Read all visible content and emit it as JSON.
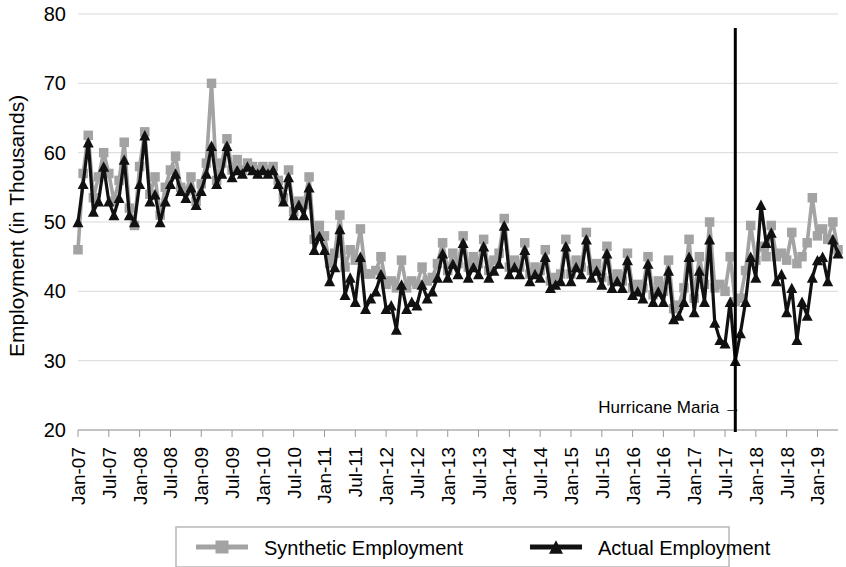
{
  "chart_data": {
    "type": "line",
    "title": "",
    "xlabel": "",
    "ylabel": "Employment (in Thousands)",
    "ylim": [
      20,
      80
    ],
    "yticks": [
      20,
      30,
      40,
      50,
      60,
      70,
      80
    ],
    "grid": true,
    "legend_position": "bottom",
    "x_tick_labels": [
      "Jan-07",
      "Jul-07",
      "Jan-08",
      "Jul-08",
      "Jan-09",
      "Jul-09",
      "Jan-10",
      "Jul-10",
      "Jan-11",
      "Jul-11",
      "Jan-12",
      "Jul-12",
      "Jan-13",
      "Jul-13",
      "Jan-14",
      "Jul-14",
      "Jan-15",
      "Jul-15",
      "Jan-16",
      "Jul-16",
      "Jan-17",
      "Jul-17",
      "Jan-18",
      "Jul-18",
      "Jan-19"
    ],
    "x_start": "Jan-07",
    "x_end": "Jan-19",
    "x_interval_months": 1,
    "annotations": [
      {
        "text": "Hurricane Maria →",
        "x": "Sep-17",
        "note": "vertical line at Sep-2017"
      }
    ],
    "series": [
      {
        "name": "Synthetic Employment",
        "color": "#a3a3a3",
        "marker": "square",
        "values": [
          46.0,
          57.0,
          62.5,
          53.5,
          56.5,
          60.0,
          57.0,
          53.0,
          56.0,
          61.5,
          52.0,
          49.5,
          58.0,
          63.0,
          54.0,
          56.5,
          51.0,
          55.0,
          57.5,
          59.5,
          55.0,
          54.5,
          56.5,
          53.0,
          55.5,
          58.5,
          70.0,
          56.0,
          58.5,
          62.0,
          57.5,
          59.0,
          57.5,
          58.5,
          58.0,
          57.5,
          58.0,
          57.5,
          58.0,
          56.0,
          53.5,
          57.5,
          51.5,
          53.0,
          52.5,
          56.5,
          47.5,
          49.5,
          48.0,
          44.0,
          45.5,
          51.0,
          43.5,
          46.0,
          44.5,
          49.0,
          42.5,
          42.5,
          43.0,
          45.0,
          41.0,
          41.5,
          40.5,
          44.5,
          40.5,
          41.5,
          41.0,
          43.5,
          41.5,
          42.0,
          44.0,
          47.0,
          43.0,
          45.5,
          44.0,
          48.0,
          43.5,
          45.0,
          44.0,
          47.5,
          43.0,
          44.5,
          45.5,
          50.5,
          43.5,
          44.5,
          43.5,
          47.0,
          42.5,
          43.5,
          43.0,
          46.0,
          41.5,
          42.0,
          42.5,
          47.5,
          42.5,
          44.5,
          43.5,
          48.5,
          43.0,
          44.0,
          42.0,
          46.5,
          41.5,
          42.5,
          41.5,
          45.5,
          40.5,
          41.0,
          40.5,
          45.0,
          39.5,
          41.5,
          40.0,
          44.5,
          37.5,
          38.0,
          40.5,
          47.5,
          39.0,
          45.0,
          41.0,
          50.0,
          40.5,
          41.0,
          40.0,
          45.0,
          38.5,
          39.0,
          43.0,
          49.5,
          44.5,
          46.5,
          45.0,
          49.5,
          45.0,
          45.5,
          44.5,
          48.5,
          44.0,
          45.0,
          47.0,
          53.5,
          48.0,
          49.0,
          47.5,
          50.0,
          46.0
        ]
      },
      {
        "name": "Actual Employment",
        "color": "#111111",
        "marker": "triangle",
        "values": [
          50.0,
          55.5,
          61.5,
          51.5,
          53.0,
          58.0,
          53.0,
          51.0,
          53.5,
          59.0,
          51.0,
          50.0,
          55.5,
          62.5,
          53.0,
          54.0,
          50.0,
          53.0,
          55.5,
          57.0,
          54.5,
          53.5,
          55.0,
          52.5,
          54.5,
          57.0,
          61.0,
          55.5,
          57.0,
          61.0,
          56.5,
          57.5,
          57.0,
          58.0,
          57.5,
          57.0,
          57.5,
          57.0,
          57.5,
          55.5,
          53.0,
          56.5,
          51.0,
          52.5,
          51.0,
          55.0,
          46.0,
          48.0,
          46.0,
          41.5,
          43.5,
          49.0,
          39.5,
          42.0,
          38.5,
          45.0,
          37.5,
          39.0,
          40.0,
          42.5,
          37.5,
          38.0,
          34.5,
          41.0,
          37.5,
          38.5,
          38.0,
          41.0,
          39.0,
          40.0,
          42.0,
          45.5,
          42.0,
          44.0,
          42.5,
          47.0,
          42.0,
          43.5,
          42.5,
          46.5,
          42.0,
          43.0,
          44.0,
          49.5,
          42.5,
          43.5,
          42.5,
          46.0,
          41.5,
          42.5,
          42.0,
          45.0,
          40.5,
          41.0,
          41.5,
          46.5,
          41.5,
          43.5,
          42.5,
          47.5,
          42.0,
          43.0,
          41.0,
          45.5,
          40.5,
          41.5,
          40.5,
          44.5,
          39.5,
          40.0,
          39.0,
          44.0,
          38.5,
          40.0,
          38.5,
          43.0,
          36.0,
          36.5,
          38.5,
          45.0,
          37.0,
          43.0,
          38.5,
          47.5,
          35.5,
          33.0,
          32.5,
          38.5,
          30.0,
          34.0,
          38.5,
          45.0,
          42.0,
          52.5,
          47.0,
          48.5,
          41.5,
          42.5,
          37.0,
          40.5,
          33.0,
          38.5,
          36.5,
          42.0,
          44.5,
          45.0,
          41.5,
          47.5,
          45.5
        ]
      }
    ]
  },
  "axis": {
    "ylabel": "Employment (in Thousands)",
    "ytick_labels": [
      "80",
      "70",
      "60",
      "50",
      "40",
      "30",
      "20"
    ]
  },
  "legend": {
    "items": [
      {
        "label": "Synthetic Employment",
        "color": "#a3a3a3",
        "marker": "square"
      },
      {
        "label": "Actual Employment",
        "color": "#111111",
        "marker": "triangle"
      }
    ]
  },
  "annotation": {
    "hurricane_label": "Hurricane Maria →"
  }
}
